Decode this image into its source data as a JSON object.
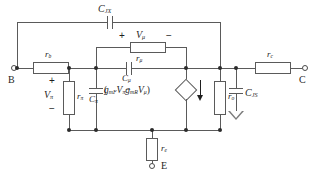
{
  "diagram": {
    "type": "electrical-schematic"
  },
  "terminals": {
    "base": "B",
    "collector": "C",
    "emitter": "E"
  },
  "components": {
    "c_jx": {
      "label_main": "C",
      "label_sub": "JX"
    },
    "c_js": {
      "label_main": "C",
      "label_sub": "JS"
    },
    "c_mu": {
      "label_main": "C",
      "label_sub": "μ"
    },
    "c_pi": {
      "label_main": "C",
      "label_sub": "π"
    },
    "r_b": {
      "label_main": "r",
      "label_sub": "b"
    },
    "r_c": {
      "label_main": "r",
      "label_sub": "c"
    },
    "r_e": {
      "label_main": "r",
      "label_sub": "e"
    },
    "r_o": {
      "label_main": "r",
      "label_sub": "o"
    },
    "r_pi": {
      "label_main": "r",
      "label_sub": "π"
    },
    "r_mu": {
      "label_main": "r",
      "label_sub": "μ"
    }
  },
  "voltages": {
    "v_pi": {
      "label_main": "V",
      "label_sub": "π",
      "plus": "+",
      "minus": "−"
    },
    "v_mu": {
      "label_main": "V",
      "label_sub": "μ",
      "plus": "+",
      "minus": "−"
    }
  },
  "source": {
    "open_paren": "(",
    "gm_forward": "g",
    "gm_forward_sub": "mF",
    "v_pi": "V",
    "v_pi_sub": "π",
    "minus": "−",
    "gm_reverse": "g",
    "gm_reverse_sub": "mR",
    "v_mu": "V",
    "v_mu_sub": "μ",
    "close_paren": ")",
    "arrow_direction": "down"
  },
  "colors": {
    "wire": "#5a5a5a",
    "text": "#1f1f1f",
    "background": "#ffffff"
  }
}
